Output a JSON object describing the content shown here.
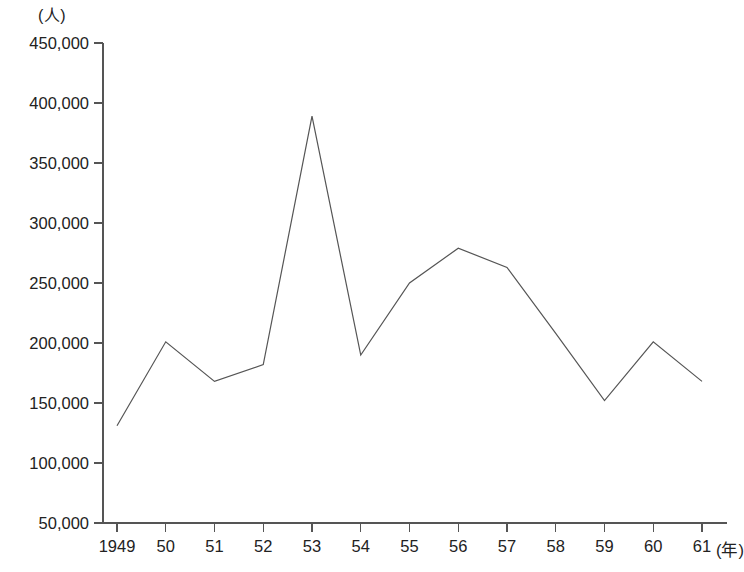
{
  "chart_data": {
    "type": "line",
    "title": "",
    "subtitle": "",
    "xlabel": "(年)",
    "ylabel": "(人)",
    "categories": [
      "1949",
      "50",
      "51",
      "52",
      "53",
      "54",
      "55",
      "56",
      "57",
      "58",
      "59",
      "60",
      "61"
    ],
    "values": [
      131000,
      201000,
      168000,
      182000,
      389000,
      190000,
      250000,
      279000,
      263000,
      208000,
      152000,
      201000,
      168000
    ],
    "x_tick_labels": [
      "1949",
      "50",
      "51",
      "52",
      "53",
      "54",
      "55",
      "56",
      "57",
      "58",
      "59",
      "60",
      "61"
    ],
    "y_tick_labels": [
      "450,000",
      "400,000",
      "350,000",
      "300,000",
      "250,000",
      "200,000",
      "150,000",
      "100,000",
      "50,000"
    ],
    "y_tick_values": [
      450000,
      400000,
      350000,
      300000,
      250000,
      200000,
      150000,
      100000,
      50000
    ],
    "ylim": [
      50000,
      450000
    ],
    "grid": false,
    "legend": null,
    "legend_position": "none",
    "line_color": "#555555",
    "axis_color": "#555555",
    "background_color": "#ffffff",
    "annotations": []
  },
  "axes": {
    "y_unit_label": "(人)",
    "x_unit_label": "(年)"
  }
}
